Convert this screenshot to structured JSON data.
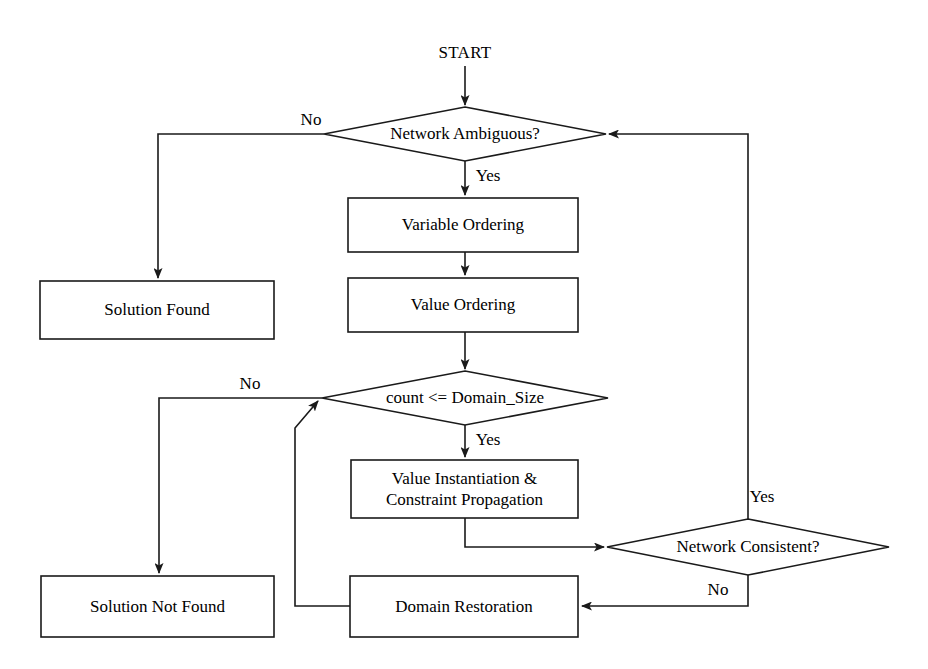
{
  "diagram": {
    "background_color": "#ffffff",
    "line_color": "#1a1a1a",
    "text_color": "#000000",
    "terminal": {
      "start_label": "START"
    },
    "nodes": [
      {
        "id": "network-ambiguous",
        "shape": "diamond",
        "label": "Network Ambiguous?",
        "cx": 465,
        "cy": 134,
        "w": 282,
        "h": 54
      },
      {
        "id": "variable-ordering",
        "shape": "rect",
        "label": "Variable Ordering",
        "x": 348,
        "y": 198,
        "w": 230,
        "h": 54
      },
      {
        "id": "value-ordering",
        "shape": "rect",
        "label": "Value Ordering",
        "x": 348,
        "y": 278,
        "w": 230,
        "h": 54
      },
      {
        "id": "solution-found",
        "shape": "rect",
        "label": "Solution Found",
        "x": 40,
        "y": 281,
        "w": 234,
        "h": 58
      },
      {
        "id": "count-domain-size",
        "shape": "diamond",
        "label": "count <= Domain_Size",
        "cx": 465,
        "cy": 398,
        "w": 286,
        "h": 54
      },
      {
        "id": "value-instantiation",
        "shape": "rect",
        "label": "Value Instantiation &\nConstraint Propagation",
        "x": 351,
        "y": 460,
        "w": 227,
        "h": 58
      },
      {
        "id": "network-consistent",
        "shape": "diamond",
        "label": "Network Consistent?",
        "cx": 748,
        "cy": 547,
        "w": 282,
        "h": 56
      },
      {
        "id": "solution-not-found",
        "shape": "rect",
        "label": "Solution Not Found",
        "x": 41,
        "y": 576,
        "w": 233,
        "h": 61
      },
      {
        "id": "domain-restoration",
        "shape": "rect",
        "label": "Domain Restoration",
        "x": 350,
        "y": 576,
        "w": 228,
        "h": 61
      }
    ],
    "edges": [
      {
        "id": "start-to-ambiguous",
        "from": "START",
        "to": "network-ambiguous",
        "label": "",
        "path": "M465,66 L465,105",
        "arrow": true
      },
      {
        "id": "ambiguous-no-to-solution-found",
        "from": "network-ambiguous",
        "to": "solution-found",
        "label": "No",
        "label_x": 311,
        "label_y": 120,
        "path": "M324,134 L158,134 L158,278",
        "arrow": true
      },
      {
        "id": "ambiguous-yes-to-variable-ordering",
        "from": "network-ambiguous",
        "to": "variable-ordering",
        "label": "Yes",
        "label_x": 488,
        "label_y": 176,
        "path": "M465,161 L465,195",
        "arrow": true
      },
      {
        "id": "variable-to-value-ordering",
        "from": "variable-ordering",
        "to": "value-ordering",
        "label": "",
        "path": "M465,252 L465,275",
        "arrow": true
      },
      {
        "id": "value-ordering-to-count",
        "from": "value-ordering",
        "to": "count-domain-size",
        "label": "",
        "path": "M465,332 L465,369",
        "arrow": true
      },
      {
        "id": "count-no-to-solution-not-found",
        "from": "count-domain-size",
        "to": "solution-not-found",
        "label": "No",
        "label_x": 250,
        "label_y": 384,
        "path": "M322,398 L159,398 L159,573",
        "arrow": true
      },
      {
        "id": "count-yes-to-value-instantiation",
        "from": "count-domain-size",
        "to": "value-instantiation",
        "label": "Yes",
        "label_x": 488,
        "label_y": 440,
        "path": "M465,425 L465,457",
        "arrow": true
      },
      {
        "id": "value-instantiation-to-network-consistent",
        "from": "value-instantiation",
        "to": "network-consistent",
        "label": "",
        "path": "M465,518 L465,547 L604,547",
        "arrow": true
      },
      {
        "id": "network-consistent-yes-to-ambiguous",
        "from": "network-consistent",
        "to": "network-ambiguous",
        "label": "Yes",
        "label_x": 762,
        "label_y": 497,
        "path": "M748,519 L748,134 L609,134",
        "arrow": true
      },
      {
        "id": "network-consistent-no-to-domain-restoration",
        "from": "network-consistent",
        "to": "domain-restoration",
        "label": "No",
        "label_x": 718,
        "label_y": 590,
        "path": "M748,575 L748,606 L582,606",
        "arrow": true
      },
      {
        "id": "domain-restoration-to-count",
        "from": "domain-restoration",
        "to": "count-domain-size",
        "label": "",
        "path": "M350,606 L295,606 L295,428 L318,401",
        "arrow": true
      }
    ]
  }
}
